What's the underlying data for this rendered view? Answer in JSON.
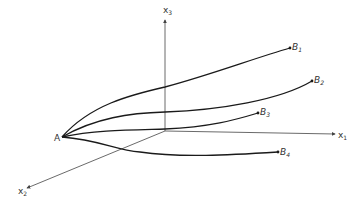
{
  "diagram": {
    "type": "3d-coordinate-trajectories",
    "axes": [
      {
        "id": "x1",
        "label": "x",
        "sub": "1"
      },
      {
        "id": "x2",
        "label": "x",
        "sub": "2"
      },
      {
        "id": "x3",
        "label": "x",
        "sub": "3"
      }
    ],
    "start_point": {
      "label": "A"
    },
    "end_points": [
      {
        "label": "B",
        "sub": "1"
      },
      {
        "label": "B",
        "sub": "2"
      },
      {
        "label": "B",
        "sub": "3"
      },
      {
        "label": "B",
        "sub": "4"
      }
    ],
    "colors": {
      "curve": "#1a1a1a",
      "axis": "#444444",
      "text": "#333333"
    }
  }
}
